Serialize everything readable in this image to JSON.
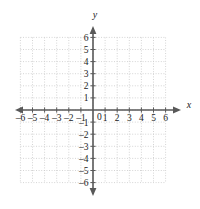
{
  "figure": {
    "kind": "cartesian-coordinate-grid",
    "axis_labels": {
      "x": "x",
      "y": "y"
    },
    "origin_label": "0",
    "colors": {
      "background": "#ffffff",
      "grid": "#c9c9c9",
      "axis": "#595959",
      "label": "#1a1a1a"
    }
  },
  "chart_data": {
    "type": "scatter",
    "title": "",
    "xlabel": "x",
    "ylabel": "y",
    "xlim": [
      -6,
      6
    ],
    "ylim": [
      -6,
      6
    ],
    "grid": true,
    "grid_step": 1,
    "legend": "none",
    "x": [],
    "y": [],
    "series": [],
    "xticks": [
      -6,
      -5,
      -4,
      -3,
      -2,
      -1,
      1,
      2,
      3,
      4,
      5,
      6
    ],
    "yticks": [
      -6,
      -5,
      -4,
      -3,
      -2,
      -1,
      1,
      2,
      3,
      4,
      5,
      6
    ],
    "xticklabels": [
      "–6",
      "–5",
      "–4",
      "–3",
      "–2",
      "–1",
      "1",
      "2",
      "3",
      "4",
      "5",
      "6"
    ],
    "yticklabels": [
      "–6",
      "–5",
      "–4",
      "–3",
      "–2",
      "–1",
      "1",
      "2",
      "3",
      "4",
      "5",
      "6"
    ],
    "annotations": [
      {
        "text": "0",
        "x": 0,
        "y": 0,
        "position": "below-right-of-origin"
      }
    ]
  }
}
